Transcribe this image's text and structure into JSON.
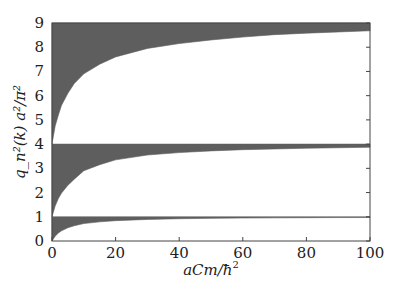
{
  "chart_data": {
    "type": "area",
    "title": "",
    "xlabel": "aCm/ħ²",
    "ylabel": "q_n²(k) a²/π²",
    "xlim": [
      0,
      100
    ],
    "ylim": [
      0,
      9
    ],
    "xticks": [
      0,
      20,
      40,
      60,
      80,
      100
    ],
    "yticks": [
      0,
      1,
      2,
      3,
      4,
      5,
      6,
      7,
      8,
      9
    ],
    "grid": false,
    "legend": null,
    "fill_color": "#5e5e5e",
    "x": [
      0,
      1,
      2,
      3,
      5,
      7,
      10,
      15,
      20,
      30,
      40,
      50,
      60,
      70,
      80,
      90,
      100
    ],
    "series": [
      {
        "name": "band 1 lower edge",
        "upper": 1,
        "values": [
          0,
          0.2,
          0.33,
          0.42,
          0.55,
          0.63,
          0.72,
          0.79,
          0.84,
          0.89,
          0.92,
          0.935,
          0.95,
          0.955,
          0.962,
          0.967,
          0.97
        ]
      },
      {
        "name": "band 2 lower edge",
        "upper": 4,
        "values": [
          1,
          1.45,
          1.75,
          1.98,
          2.3,
          2.55,
          2.9,
          3.15,
          3.35,
          3.55,
          3.65,
          3.72,
          3.77,
          3.8,
          3.83,
          3.85,
          3.87
        ]
      },
      {
        "name": "band 3 lower edge",
        "upper": 9,
        "values": [
          4,
          4.75,
          5.2,
          5.6,
          6.1,
          6.5,
          6.9,
          7.3,
          7.6,
          7.95,
          8.15,
          8.3,
          8.42,
          8.52,
          8.58,
          8.63,
          8.68
        ]
      }
    ]
  },
  "axes": {
    "xlabel_main": "aCm/",
    "xlabel_hbar": "ħ",
    "xlabel_sup": "2"
  }
}
